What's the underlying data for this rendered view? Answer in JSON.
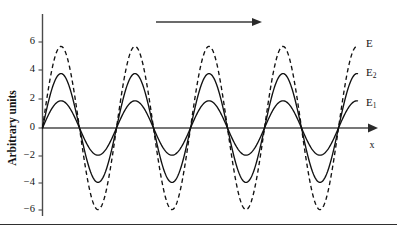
{
  "chart_data": {
    "type": "line",
    "title": "",
    "xlabel": "x",
    "ylabel": "Arbitrary units",
    "xlim": [
      0,
      4.5
    ],
    "ylim": [
      -7.2,
      7.2
    ],
    "grid": false,
    "legend_position": "right-inline",
    "y_ticks": [
      6,
      4,
      2,
      0,
      -2,
      -4,
      -6
    ],
    "y_tick_labels": [
      "6",
      "4",
      "2",
      "0",
      "-2",
      "-4",
      "-6"
    ],
    "x_ticks": [],
    "x_tick_labels": [],
    "series": [
      {
        "name": "E1",
        "label": "E",
        "subscript": "1",
        "amplitude": 2,
        "wavelength": 1,
        "phase": 0,
        "style": "solid",
        "color": "#111111",
        "label_y": 2.0
      },
      {
        "name": "E2",
        "label": "E",
        "subscript": "2",
        "amplitude": 4,
        "wavelength": 1,
        "phase": 0,
        "style": "solid",
        "color": "#111111",
        "label_y": 4.2
      },
      {
        "name": "E",
        "label": "E",
        "subscript": "",
        "amplitude": 6,
        "wavelength": 1,
        "phase": 0,
        "style": "dashed",
        "color": "#111111",
        "label_y": 6.3
      }
    ],
    "annotations": [
      {
        "name": "propagation-direction-arrow",
        "type": "arrow",
        "direction": "right",
        "text": ""
      }
    ]
  },
  "axes": {
    "y_axis_title": "Arbitrary units",
    "x_axis_title": "x"
  },
  "labels": {
    "e_total": "E",
    "e_two": "E",
    "e_two_sub": "2",
    "e_one": "E",
    "e_one_sub": "1",
    "tick_6": "6",
    "tick_4": "4",
    "tick_2": "2",
    "tick_0": "0",
    "tick_m2": "−2",
    "tick_m4": "−4",
    "tick_m6": "−6"
  },
  "colors": {
    "curve": "#111111",
    "axis": "#4a4a4a",
    "background": "#ffffff",
    "rule": "#2f2f2f"
  }
}
